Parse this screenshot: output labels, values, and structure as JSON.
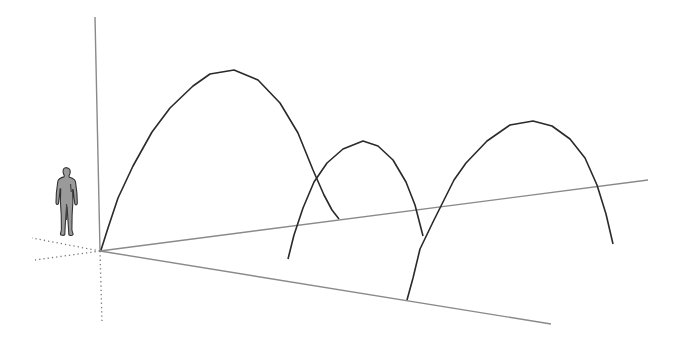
{
  "scene": {
    "type": "3d-viewport",
    "background": "#ffffff",
    "origin": [
      100,
      251
    ],
    "colors": {
      "arc_stroke": "#2a2a2a",
      "axis_stroke": "#8a8a8a",
      "axis_dotted": "#7a7a7a",
      "figure_fill": "#9a9a9a",
      "figure_stroke": "#333333"
    },
    "axes": [
      {
        "name": "vertical-axis",
        "from": [
          100,
          251
        ],
        "to": [
          95,
          17
        ],
        "style": "solid"
      },
      {
        "name": "right-axis",
        "from": [
          100,
          251
        ],
        "to": [
          648,
          180
        ],
        "style": "solid"
      },
      {
        "name": "lower-axis",
        "from": [
          100,
          251
        ],
        "to": [
          551,
          324
        ],
        "style": "solid"
      },
      {
        "name": "down-axis-dotted",
        "from": [
          100,
          251
        ],
        "to": [
          102,
          322
        ],
        "style": "dotted"
      },
      {
        "name": "left-axis-dotted",
        "from": [
          100,
          251
        ],
        "to": [
          32,
          238
        ],
        "style": "dotted"
      },
      {
        "name": "back-axis-dotted",
        "from": [
          100,
          251
        ],
        "to": [
          35,
          260
        ],
        "style": "dotted"
      }
    ],
    "arcs": [
      {
        "name": "large-arc",
        "points": [
          [
            101,
            250
          ],
          [
            108,
            228
          ],
          [
            118,
            198
          ],
          [
            133,
            166
          ],
          [
            152,
            132
          ],
          [
            170,
            108
          ],
          [
            193,
            86
          ],
          [
            210,
            74
          ],
          [
            234,
            70
          ],
          [
            258,
            80
          ],
          [
            280,
            103
          ],
          [
            298,
            133
          ],
          [
            313,
            170
          ],
          [
            324,
            195
          ],
          [
            332,
            210
          ],
          [
            339,
            219
          ]
        ]
      },
      {
        "name": "middle-arc",
        "points": [
          [
            288,
            259
          ],
          [
            294,
            235
          ],
          [
            303,
            208
          ],
          [
            314,
            182
          ],
          [
            327,
            163
          ],
          [
            343,
            149
          ],
          [
            363,
            141
          ],
          [
            378,
            146
          ],
          [
            393,
            160
          ],
          [
            406,
            182
          ],
          [
            415,
            205
          ],
          [
            423,
            236
          ]
        ]
      },
      {
        "name": "right-arc",
        "points": [
          [
            407,
            300
          ],
          [
            413,
            278
          ],
          [
            420,
            249
          ],
          [
            433,
            222
          ],
          [
            454,
            180
          ],
          [
            466,
            163
          ],
          [
            487,
            141
          ],
          [
            510,
            125
          ],
          [
            533,
            121
          ],
          [
            552,
            126
          ],
          [
            570,
            139
          ],
          [
            585,
            158
          ],
          [
            597,
            185
          ],
          [
            606,
            214
          ],
          [
            613,
            244
          ]
        ]
      }
    ],
    "scale_figure": {
      "name": "person",
      "x": 56,
      "y": 167,
      "width": 22,
      "height": 74
    }
  }
}
